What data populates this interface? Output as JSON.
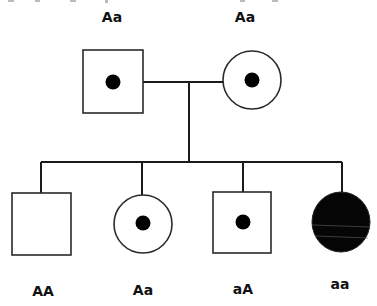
{
  "diagram": {
    "type": "pedigree-chart",
    "generations": [
      {
        "label": "parents",
        "members": [
          {
            "id": "father",
            "sex": "male",
            "shape": "square",
            "status": "carrier",
            "genotype": "Aa"
          },
          {
            "id": "mother",
            "sex": "female",
            "shape": "circle",
            "status": "carrier",
            "genotype": "Aa"
          }
        ]
      },
      {
        "label": "offspring",
        "members": [
          {
            "id": "child1",
            "sex": "male",
            "shape": "square",
            "status": "unaffected",
            "genotype": "AA"
          },
          {
            "id": "child2",
            "sex": "female",
            "shape": "circle",
            "status": "carrier",
            "genotype": "Aa"
          },
          {
            "id": "child3",
            "sex": "male",
            "shape": "square",
            "status": "carrier",
            "genotype": "aA"
          },
          {
            "id": "child4",
            "sex": "female",
            "shape": "circle",
            "status": "affected",
            "genotype": "aa"
          }
        ]
      }
    ]
  },
  "labels": {
    "father": "Aa",
    "mother": "Aa",
    "child1": "AA",
    "child2": "Aa",
    "child3": "aA",
    "child4": "aa"
  },
  "colors": {
    "line": "#1a1a1a",
    "affected_fill": "#050505",
    "carrier_dot": "#000000",
    "background": "#ffffff"
  }
}
